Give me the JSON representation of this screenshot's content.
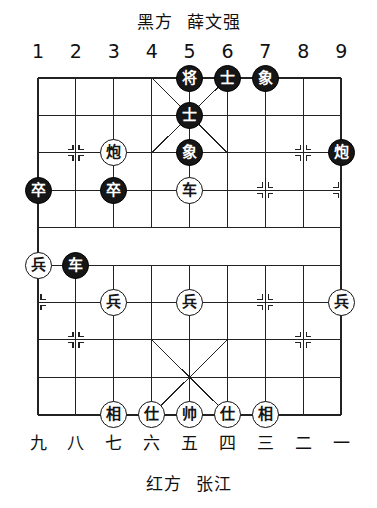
{
  "header": {
    "side_label": "黑方",
    "player_name": "薛文强"
  },
  "footer": {
    "side_label": "红方",
    "player_name": "张江"
  },
  "coordinates": {
    "top_files": [
      "1",
      "2",
      "3",
      "4",
      "5",
      "6",
      "7",
      "8",
      "9"
    ],
    "bottom_files": [
      "九",
      "八",
      "七",
      "六",
      "五",
      "四",
      "三",
      "二",
      "一"
    ]
  },
  "board": {
    "files": 9,
    "ranks": 10,
    "origin_x": 38,
    "origin_y": 78,
    "cell_w": 37.9,
    "cell_h": 37.4,
    "river_top_rank": 4,
    "river_bottom_rank": 5,
    "line_color": "#222222",
    "background_color": "#ffffff",
    "marker_points": [
      {
        "file": 2,
        "rank": 2
      },
      {
        "file": 8,
        "rank": 2
      },
      {
        "file": 1,
        "rank": 3
      },
      {
        "file": 3,
        "rank": 3
      },
      {
        "file": 5,
        "rank": 3
      },
      {
        "file": 7,
        "rank": 3
      },
      {
        "file": 9,
        "rank": 3
      },
      {
        "file": 1,
        "rank": 6
      },
      {
        "file": 3,
        "rank": 6
      },
      {
        "file": 5,
        "rank": 6
      },
      {
        "file": 7,
        "rank": 6
      },
      {
        "file": 9,
        "rank": 6
      },
      {
        "file": 2,
        "rank": 7
      },
      {
        "file": 8,
        "rank": 7
      }
    ]
  },
  "pieces": [
    {
      "id": "b-general-5-0",
      "glyph": "将",
      "side": "black",
      "file": 5,
      "rank": 0,
      "name": "piece-black-general"
    },
    {
      "id": "b-advisor-6-0",
      "glyph": "士",
      "side": "black",
      "file": 6,
      "rank": 0,
      "name": "piece-black-advisor"
    },
    {
      "id": "b-elephant-7-0",
      "glyph": "象",
      "side": "black",
      "file": 7,
      "rank": 0,
      "name": "piece-black-elephant"
    },
    {
      "id": "b-advisor-5-1",
      "glyph": "士",
      "side": "black",
      "file": 5,
      "rank": 1,
      "name": "piece-black-advisor"
    },
    {
      "id": "r-cannon-3-2",
      "glyph": "炮",
      "side": "red",
      "file": 3,
      "rank": 2,
      "name": "piece-red-cannon"
    },
    {
      "id": "b-elephant-5-2",
      "glyph": "象",
      "side": "black",
      "file": 5,
      "rank": 2,
      "name": "piece-black-elephant"
    },
    {
      "id": "b-cannon-9-2",
      "glyph": "炮",
      "side": "black",
      "file": 9,
      "rank": 2,
      "name": "piece-black-cannon"
    },
    {
      "id": "b-pawn-1-3",
      "glyph": "卒",
      "side": "black",
      "file": 1,
      "rank": 3,
      "name": "piece-black-pawn"
    },
    {
      "id": "b-pawn-3-3",
      "glyph": "卒",
      "side": "black",
      "file": 3,
      "rank": 3,
      "name": "piece-black-pawn"
    },
    {
      "id": "r-chariot-5-3",
      "glyph": "车",
      "side": "red",
      "file": 5,
      "rank": 3,
      "name": "piece-red-chariot"
    },
    {
      "id": "r-pawn-1-5",
      "glyph": "兵",
      "side": "red",
      "file": 1,
      "rank": 5,
      "name": "piece-red-pawn"
    },
    {
      "id": "b-chariot-2-5",
      "glyph": "车",
      "side": "black",
      "file": 2,
      "rank": 5,
      "name": "piece-black-chariot"
    },
    {
      "id": "r-pawn-3-6",
      "glyph": "兵",
      "side": "red",
      "file": 3,
      "rank": 6,
      "name": "piece-red-pawn"
    },
    {
      "id": "r-pawn-5-6",
      "glyph": "兵",
      "side": "red",
      "file": 5,
      "rank": 6,
      "name": "piece-red-pawn"
    },
    {
      "id": "r-pawn-9-6",
      "glyph": "兵",
      "side": "red",
      "file": 9,
      "rank": 6,
      "name": "piece-red-pawn"
    },
    {
      "id": "r-elephant-3-9",
      "glyph": "相",
      "side": "red",
      "file": 3,
      "rank": 9,
      "name": "piece-red-elephant"
    },
    {
      "id": "r-advisor-4-9",
      "glyph": "仕",
      "side": "red",
      "file": 4,
      "rank": 9,
      "name": "piece-red-advisor"
    },
    {
      "id": "r-general-5-9",
      "glyph": "帅",
      "side": "red",
      "file": 5,
      "rank": 9,
      "name": "piece-red-general"
    },
    {
      "id": "r-advisor-6-9",
      "glyph": "仕",
      "side": "red",
      "file": 6,
      "rank": 9,
      "name": "piece-red-advisor"
    },
    {
      "id": "r-elephant-7-9",
      "glyph": "相",
      "side": "red",
      "file": 7,
      "rank": 9,
      "name": "piece-red-elephant"
    }
  ]
}
